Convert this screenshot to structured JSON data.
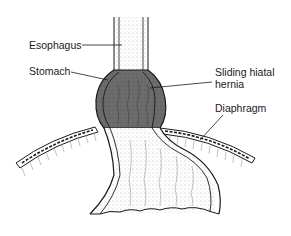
{
  "diagram": {
    "labels": {
      "esophagus": "Esophagus",
      "stomach": "Stomach",
      "sliding_hiatal_hernia_line1": "Sliding hiatal",
      "sliding_hiatal_hernia_line2": "hernia",
      "diaphragm": "Diaphragm"
    },
    "colors": {
      "herniated_stomach_fill": "#6b6b6b",
      "outline": "#1a1a1a",
      "background": "#ffffff"
    }
  }
}
